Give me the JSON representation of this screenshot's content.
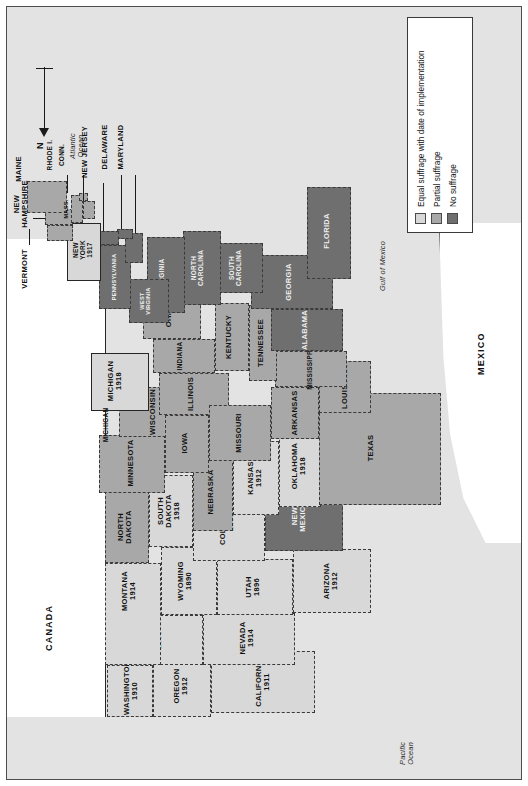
{
  "map": {
    "title_present": false,
    "orientation_note": "map printed rotated 90 degrees on the page",
    "north_label": "N",
    "nations": [
      {
        "name": "CANADA"
      },
      {
        "name": "MEXICO"
      }
    ],
    "water_labels": [
      {
        "name": "Atlantic\nOcean"
      },
      {
        "name": "Pacific\nOcean"
      },
      {
        "name": "Gulf of Mexico"
      }
    ],
    "scale": {
      "unit": "km",
      "ticks": [
        "0",
        "250",
        "500"
      ]
    }
  },
  "legend": {
    "items": [
      {
        "label": "Equal suffrage with date of implementation",
        "color": "#d8d8d8",
        "key": "equal"
      },
      {
        "label": "Partial suffrage",
        "color": "#a8a8a8",
        "key": "partial"
      },
      {
        "label": "No suffrage",
        "color": "#6f6f6f",
        "key": "none"
      }
    ]
  },
  "colors": {
    "equal": "#d8d8d8",
    "partial": "#a8a8a8",
    "none": "#6f6f6f",
    "ocean": "#e3e3e3",
    "outline": "#262626",
    "frame": "#4d4d4d"
  },
  "states": [
    {
      "name": "WASHINGTON",
      "date": "1910",
      "status": "equal"
    },
    {
      "name": "OREGON",
      "date": "1912",
      "status": "equal"
    },
    {
      "name": "CALIFORNIA",
      "date": "1911",
      "status": "equal"
    },
    {
      "name": "NEVADA",
      "date": "1914",
      "status": "equal"
    },
    {
      "name": "IDAHO",
      "date": "1896",
      "status": "equal"
    },
    {
      "name": "MONTANA",
      "date": "1914",
      "status": "equal"
    },
    {
      "name": "WYOMING",
      "date": "1890",
      "status": "equal"
    },
    {
      "name": "UTAH",
      "date": "1896",
      "status": "equal"
    },
    {
      "name": "ARIZONA",
      "date": "1912",
      "status": "equal"
    },
    {
      "name": "COLORADO",
      "date": "1893",
      "status": "equal"
    },
    {
      "name": "NEW\nMEXICO",
      "date": "",
      "status": "none"
    },
    {
      "name": "NORTH\nDAKOTA",
      "date": "",
      "status": "partial"
    },
    {
      "name": "SOUTH\nDAKOTA",
      "date": "1918",
      "status": "equal"
    },
    {
      "name": "NEBRASKA",
      "date": "",
      "status": "partial"
    },
    {
      "name": "KANSAS",
      "date": "1912",
      "status": "equal"
    },
    {
      "name": "OKLAHOMA",
      "date": "1918",
      "status": "equal"
    },
    {
      "name": "TEXAS",
      "date": "",
      "status": "partial"
    },
    {
      "name": "MINNESOTA",
      "date": "",
      "status": "partial"
    },
    {
      "name": "IOWA",
      "date": "",
      "status": "partial"
    },
    {
      "name": "MISSOURI",
      "date": "",
      "status": "partial"
    },
    {
      "name": "ARKANSAS",
      "date": "",
      "status": "partial"
    },
    {
      "name": "LOUISIANA",
      "date": "",
      "status": "partial"
    },
    {
      "name": "WISCONSIN",
      "date": "",
      "status": "partial"
    },
    {
      "name": "MICHIGAN",
      "date": "1918",
      "status": "equal"
    },
    {
      "name": "ILLINOIS",
      "date": "",
      "status": "partial"
    },
    {
      "name": "INDIANA",
      "date": "",
      "status": "partial"
    },
    {
      "name": "OHIO",
      "date": "",
      "status": "partial"
    },
    {
      "name": "KENTUCKY",
      "date": "",
      "status": "partial"
    },
    {
      "name": "TENNESSEE",
      "date": "",
      "status": "partial"
    },
    {
      "name": "MISSISSIPPI",
      "date": "",
      "status": "partial"
    },
    {
      "name": "ALABAMA",
      "date": "",
      "status": "none"
    },
    {
      "name": "GEORGIA",
      "date": "",
      "status": "none"
    },
    {
      "name": "FLORIDA",
      "date": "",
      "status": "none"
    },
    {
      "name": "SOUTH\nCAROLINA",
      "date": "",
      "status": "none"
    },
    {
      "name": "NORTH\nCAROLINA",
      "date": "",
      "status": "none"
    },
    {
      "name": "VIRGINIA",
      "date": "",
      "status": "none"
    },
    {
      "name": "WEST\nVIRGINIA",
      "date": "",
      "status": "none"
    },
    {
      "name": "MARYLAND",
      "date": "",
      "status": "none"
    },
    {
      "name": "DELAWARE",
      "date": "",
      "status": "none"
    },
    {
      "name": "PENNSYLVANIA",
      "date": "",
      "status": "none"
    },
    {
      "name": "NEW\nJERSEY",
      "date": "",
      "status": "none"
    },
    {
      "name": "NEW\nYORK",
      "date": "1917",
      "status": "equal"
    },
    {
      "name": "CONN.",
      "date": "",
      "status": "partial"
    },
    {
      "name": "RHODE I.",
      "date": "",
      "status": "partial"
    },
    {
      "name": "MASS.",
      "date": "",
      "status": "partial"
    },
    {
      "name": "VERMONT",
      "date": "",
      "status": "partial"
    },
    {
      "name": "NEW\nHAMPSHIRE",
      "date": "",
      "status": "partial"
    },
    {
      "name": "MAINE",
      "date": "",
      "status": "partial"
    }
  ],
  "labels": {
    "canada": "CANADA",
    "mexico": "MEXICO",
    "atlantic": "Atlantic\nOcean",
    "pacific": "Pacific\nOcean",
    "gulf": "Gulf of Mexico",
    "north": "N",
    "km": "km",
    "s0": "0",
    "s250": "250",
    "s500": "500",
    "washington": "WASHINGTON",
    "washington_d": "1910",
    "oregon": "OREGON",
    "oregon_d": "1912",
    "california": "CALIFORNIA",
    "california_d": "1911",
    "nevada": "NEVADA",
    "nevada_d": "1914",
    "idaho": "IDAHO",
    "idaho_d": "1896",
    "montana": "MONTANA",
    "montana_d": "1914",
    "wyoming": "WYOMING",
    "wyoming_d": "1890",
    "utah": "UTAH",
    "utah_d": "1896",
    "arizona": "ARIZONA",
    "arizona_d": "1912",
    "colorado": "COLORADO",
    "colorado_d": "1893",
    "newmexico": "NEW\nMEXICO",
    "northdakota": "NORTH\nDAKOTA",
    "southdakota": "SOUTH\nDAKOTA",
    "southdakota_d": "1918",
    "nebraska": "NEBRASKA",
    "kansas": "KANSAS",
    "kansas_d": "1912",
    "oklahoma": "OKLAHOMA",
    "oklahoma_d": "1918",
    "texas": "TEXAS",
    "minnesota": "MINNESOTA",
    "iowa": "IOWA",
    "missouri": "MISSOURI",
    "arkansas": "ARKANSAS",
    "louisiana": "LOUISIANA",
    "wisconsin": "WISCONSIN",
    "michigan": "MICHIGAN",
    "michigan_d": "1918",
    "michigan2": "MICHIGAN",
    "illinois": "ILLINOIS",
    "indiana": "INDIANA",
    "ohio": "OHIO",
    "kentucky": "KENTUCKY",
    "tennessee": "TENNESSEE",
    "mississippi": "MISSISSIPPI",
    "alabama": "ALABAMA",
    "georgia": "GEORGIA",
    "florida": "FLORIDA",
    "southcarolina": "SOUTH\nCAROLINA",
    "northcarolina": "NORTH\nCAROLINA",
    "virginia": "VIRGINIA",
    "westvirginia": "WEST\nVIRGINIA",
    "maryland": "MARYLAND",
    "delaware": "DELAWARE",
    "pennsylvania": "PENNSYLVANIA",
    "newjersey": "NEW JERSEY",
    "newyork": "NEW\nYORK",
    "newyork_d": "1917",
    "conn": "CONN.",
    "rhodeisland": "RHODE I.",
    "mass": "MASS.",
    "vermont": "VERMONT",
    "newhampshire": "NEW\nHAMPSHIRE",
    "maine": "MAINE",
    "legend_equal": "Equal suffrage with date of implementation",
    "legend_partial": "Partial suffrage",
    "legend_none": "No suffrage"
  }
}
